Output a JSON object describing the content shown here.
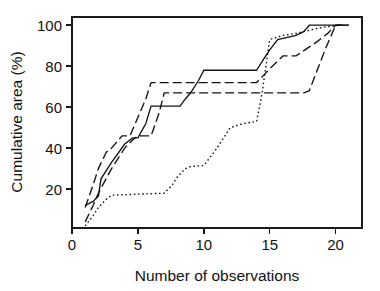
{
  "chart_data": {
    "type": "line",
    "title": "",
    "xlabel": "Number of observations",
    "ylabel": "Cumulative area (%)",
    "xlim": [
      0,
      22
    ],
    "ylim": [
      1,
      104
    ],
    "grid": false,
    "legend": "none",
    "xticks": [
      0,
      5,
      10,
      15,
      20
    ],
    "xtick_labels": [
      "0",
      "5",
      "10",
      "15",
      "20"
    ],
    "yticks": [
      20,
      40,
      60,
      80,
      100
    ],
    "ytick_labels": [
      "20",
      "40",
      "60",
      "80",
      "100"
    ],
    "series": [
      {
        "name": "curve-solid",
        "style": "solid",
        "dash": "none",
        "color": "#141414",
        "x": [
          1,
          1.6,
          2,
          2.2,
          3,
          4,
          4.6,
          5,
          5.6,
          6,
          8.2,
          8.6,
          9,
          9.6,
          10,
          14,
          14.6,
          15,
          15.6,
          17,
          17.6,
          18,
          21
        ],
        "y": [
          12,
          14,
          16.5,
          25,
          33,
          42,
          45,
          45,
          52,
          60.5,
          60.5,
          64,
          67,
          73,
          78,
          78,
          84,
          88,
          93,
          95,
          97,
          100,
          100
        ]
      },
      {
        "name": "curve-dashed-upper",
        "style": "dashed",
        "dash": "9,4",
        "color": "#141414",
        "x": [
          1,
          1.6,
          2,
          2.6,
          3,
          3.8,
          4.4,
          5,
          5.6,
          6,
          14,
          14.6,
          15.2,
          16,
          17,
          18.6,
          19.4,
          20,
          21
        ],
        "y": [
          11,
          22,
          30,
          38,
          40,
          46,
          46,
          55,
          64,
          72,
          72,
          76,
          80,
          85,
          85,
          92,
          96,
          100,
          100
        ]
      },
      {
        "name": "curve-dashed-lower",
        "style": "dashed",
        "dash": "9,4",
        "color": "#141414",
        "x": [
          1,
          1.6,
          2,
          3,
          4,
          4.6,
          5,
          6,
          6.6,
          7,
          17.6,
          18,
          18.6,
          19.2,
          20,
          21
        ],
        "y": [
          4,
          12,
          18,
          30,
          40,
          44,
          46,
          46,
          57,
          67,
          67,
          68,
          78,
          88,
          100,
          100
        ]
      },
      {
        "name": "curve-dotted",
        "style": "dotted",
        "dash": "1.6,2.6",
        "color": "#141414",
        "x": [
          1,
          1.6,
          2,
          2.6,
          3,
          5,
          7,
          7.6,
          8,
          8.6,
          9,
          10,
          11,
          11.6,
          12,
          13,
          14,
          14.4,
          15,
          16,
          17,
          18,
          19,
          20.4
        ],
        "y": [
          2,
          7,
          11,
          15,
          17,
          17.5,
          18,
          22,
          26,
          30,
          31,
          31.5,
          40,
          46,
          50,
          52,
          53,
          66,
          93,
          95,
          96,
          97.5,
          99,
          100
        ]
      }
    ]
  },
  "axes": {
    "x_axis_name": "x-axis",
    "y_axis_name": "y-axis"
  }
}
